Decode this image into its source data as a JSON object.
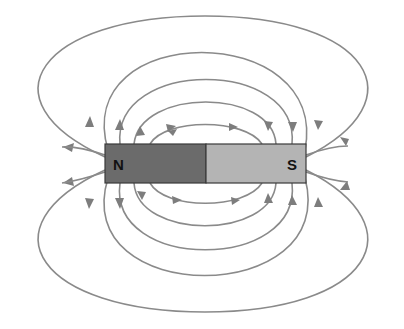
{
  "diagram": {
    "magnet": {
      "north_label": "N",
      "south_label": "S",
      "north_color": "#6b6b6b",
      "south_color": "#b4b4b4",
      "outline_color": "#3a3a3a",
      "x": 105,
      "y": 144,
      "width": 201,
      "height": 39
    },
    "field_line_color": "#8a8a8a",
    "field_lines": {
      "top_apex_y": [
        125,
        98,
        72,
        44,
        16
      ],
      "bottom_apex_y": [
        205,
        228,
        254,
        282,
        312
      ],
      "direction": "N to S (exit north, enter south)"
    }
  }
}
